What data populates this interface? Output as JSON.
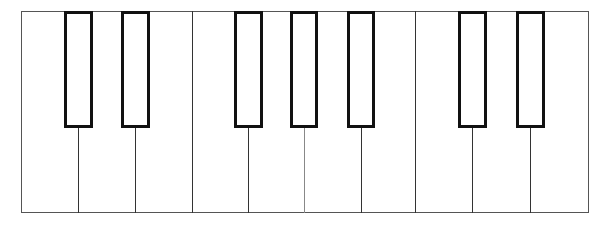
{
  "keyboard": {
    "frame": {
      "left": 21,
      "top": 11,
      "right": 589,
      "bottom": 213
    },
    "black_key_bottom": 128,
    "colors": {
      "outline": "#111111",
      "divider": "#333333",
      "frame": "#555555",
      "fill": "#ffffff"
    },
    "white_key_edges": [
      21,
      78,
      135,
      192,
      248,
      304,
      361,
      415,
      472,
      530,
      589
    ],
    "full_dividers": [
      192,
      415
    ],
    "lower_dividers": [
      {
        "x": 78
      },
      {
        "x": 135
      },
      {
        "x": 248
      },
      {
        "x": 304,
        "light": true
      },
      {
        "x": 361
      },
      {
        "x": 472
      },
      {
        "x": 530
      }
    ],
    "black_keys": [
      {
        "name": "black-key-1",
        "left": 64,
        "right": 93
      },
      {
        "name": "black-key-2",
        "left": 121,
        "right": 150
      },
      {
        "name": "black-key-3",
        "left": 234,
        "right": 263
      },
      {
        "name": "black-key-4",
        "left": 290,
        "right": 318
      },
      {
        "name": "black-key-5",
        "left": 347,
        "right": 375
      },
      {
        "name": "black-key-6",
        "left": 458,
        "right": 487
      },
      {
        "name": "black-key-7",
        "left": 516,
        "right": 545
      }
    ]
  }
}
